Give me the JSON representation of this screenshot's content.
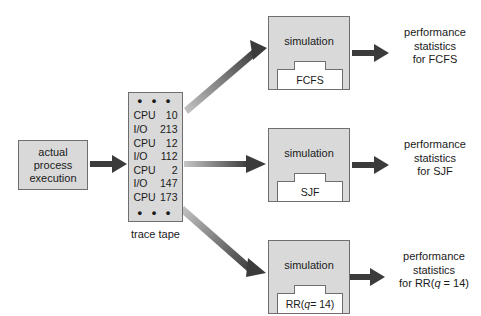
{
  "diagram": {
    "source_box": {
      "line1": "actual",
      "line2": "process",
      "line3": "execution"
    },
    "trace_tape": {
      "label": "trace tape",
      "top_ellipsis": "• • •",
      "bottom_ellipsis": "• • •",
      "rows": [
        {
          "op": "CPU",
          "value": "10"
        },
        {
          "op": "I/O",
          "value": "213"
        },
        {
          "op": "CPU",
          "value": "12"
        },
        {
          "op": "I/O",
          "value": "112"
        },
        {
          "op": "CPU",
          "value": "2"
        },
        {
          "op": "I/O",
          "value": "147"
        },
        {
          "op": "CPU",
          "value": "173"
        }
      ]
    },
    "simulations": [
      {
        "title": "simulation",
        "algorithm_prefix": "FCFS",
        "algorithm_italic": "",
        "algorithm_suffix": "",
        "result_line1": "performance",
        "result_line2": "statistics",
        "result_line3": "for FCFS"
      },
      {
        "title": "simulation",
        "algorithm_prefix": "SJF",
        "algorithm_italic": "",
        "algorithm_suffix": "",
        "result_line1": "performance",
        "result_line2": "statistics",
        "result_line3": "for SJF"
      },
      {
        "title": "simulation",
        "algorithm_prefix": "RR(",
        "algorithm_italic": "q",
        "algorithm_suffix": " = 14)",
        "result_line1": "performance",
        "result_line2": "statistics",
        "result_line3_prefix": "for RR(",
        "result_line3_italic": "q",
        "result_line3_suffix": " = 14)"
      }
    ],
    "colors": {
      "box_fill": "#d9d9d9",
      "box_stroke": "#6e6e6e",
      "plate_fill": "#ffffff",
      "arrow_dark": "#3b3b3b",
      "arrow_light": "#c2c2c2",
      "text": "#1a1a1a",
      "background": "#ffffff"
    }
  }
}
